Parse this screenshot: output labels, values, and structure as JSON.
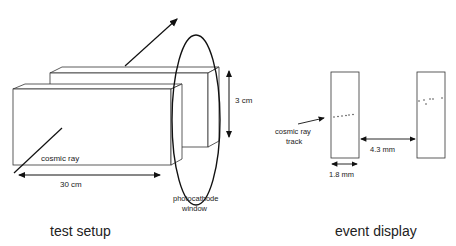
{
  "left_panel": {
    "caption": "test setup",
    "cosmic_ray_label": "cosmic ray",
    "length_label": "30 cm",
    "height_label": "3 cm",
    "window_label_line1": "photocathode",
    "window_label_line2": "window"
  },
  "right_panel": {
    "caption": "event display",
    "track_label_line1": "cosmic ray",
    "track_label_line2": "track",
    "width_label": "1.8 mm",
    "gap_label": "4.3 mm"
  }
}
